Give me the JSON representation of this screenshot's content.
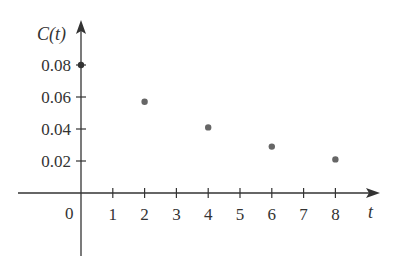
{
  "chart_data": {
    "type": "scatter",
    "title": "",
    "xlabel": "t",
    "ylabel": "C(t)",
    "origin_label": "0",
    "x": [
      0,
      2,
      4,
      6,
      8
    ],
    "values": [
      0.08,
      0.057,
      0.041,
      0.029,
      0.021
    ],
    "series": [
      {
        "name": "C(t)",
        "x": [
          0,
          2,
          4,
          6,
          8
        ],
        "values": [
          0.08,
          0.057,
          0.041,
          0.029,
          0.021
        ]
      }
    ],
    "x_ticks": [
      "1",
      "2",
      "3",
      "4",
      "5",
      "6",
      "7",
      "8"
    ],
    "y_ticks": [
      "0.02",
      "0.04",
      "0.06",
      "0.08"
    ],
    "xlim": [
      -2,
      9
    ],
    "ylim": [
      -0.04,
      0.1
    ],
    "grid": false,
    "legend": "none",
    "colors": {
      "axis": "#333333",
      "point": "#666666",
      "text": "#333333"
    }
  }
}
